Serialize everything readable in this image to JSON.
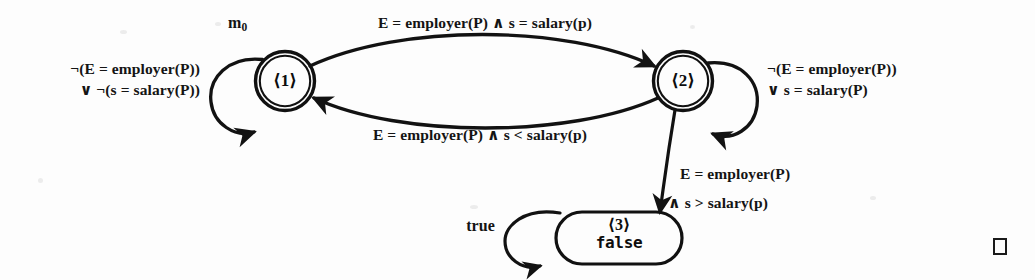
{
  "figure": {
    "kind": "state-transition-diagram",
    "caption_symbol": "□"
  },
  "states": [
    {
      "id": "state-1",
      "label": "⟨1⟩",
      "shape": "double-circle",
      "initial_marker": "m",
      "initial_marker_sub": "0"
    },
    {
      "id": "state-2",
      "label": "⟨2⟩",
      "shape": "double-circle"
    },
    {
      "id": "state-3",
      "label": "⟨3⟩",
      "value": "false",
      "shape": "rounded-rectangle"
    }
  ],
  "transitions": {
    "s1_self": {
      "from": "state-1",
      "to": "state-1",
      "line1": "¬(E = employer(P))",
      "line2": "∨ ¬(s = salary(P))"
    },
    "s1_to_s2": {
      "from": "state-1",
      "to": "state-2",
      "label": "E = employer(P) ∧ s = salary(p)"
    },
    "s2_to_s1": {
      "from": "state-2",
      "to": "state-1",
      "label": "E = employer(P) ∧ s <  salary(p)"
    },
    "s2_self": {
      "from": "state-2",
      "to": "state-2",
      "line1": "¬(E = employer(P))",
      "line2": "∨  s = salary(P)"
    },
    "s2_to_s3": {
      "from": "state-2",
      "to": "state-3",
      "line1": "E = employer(P)",
      "line2": "∧ s > salary(p)"
    },
    "s3_self": {
      "from": "state-3",
      "to": "state-3",
      "label": "true"
    }
  },
  "colors": {
    "ink": "#141414",
    "background": "#fdfdfd"
  }
}
